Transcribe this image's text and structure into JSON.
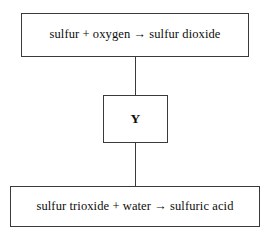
{
  "diagram": {
    "type": "flow-diagram",
    "title": "",
    "background_color": "#ffffff",
    "border_color": "#3a3a3a",
    "text_color": "#0d0d0d",
    "nodes": [
      {
        "id": "reaction-1",
        "label": "sulfur + oxygen → sulfur dioxide",
        "emphasis": "normal"
      },
      {
        "id": "unknown-step",
        "label": "Y",
        "emphasis": "bold"
      },
      {
        "id": "reaction-2",
        "label": "sulfur trioxide + water → sulfuric acid",
        "emphasis": "normal"
      }
    ],
    "connectors": [
      {
        "id": "connector-top",
        "from": "reaction-1",
        "to": "unknown-step",
        "style": "plain-line",
        "orientation": "vertical"
      },
      {
        "id": "connector-bottom",
        "from": "unknown-step",
        "to": "reaction-2",
        "style": "plain-line",
        "orientation": "vertical"
      }
    ]
  }
}
